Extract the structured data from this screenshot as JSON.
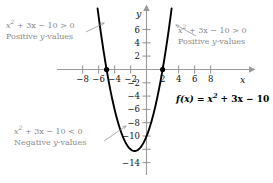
{
  "chart_data": {
    "type": "line",
    "title": "",
    "function_label": "f(x) = x^2 + 3x - 10",
    "equation_coefficients": {
      "a": 1,
      "b": 3,
      "c": -10
    },
    "xlabel": "x",
    "ylabel": "y",
    "xlim": [
      -9.6,
      9.6
    ],
    "ylim": [
      -15.5,
      7.6
    ],
    "grid": false,
    "legend": "none",
    "x_ticks": [
      -8,
      -6,
      -4,
      -2,
      2,
      4,
      6,
      8
    ],
    "x_tick_labels": [
      "-8",
      "-6",
      "-4",
      "-2",
      "2",
      "4",
      "6",
      "8"
    ],
    "y_ticks": [
      6,
      4,
      2,
      -2,
      -4,
      -6,
      -8,
      -10,
      -12,
      -14
    ],
    "y_tick_labels": [
      "6",
      "4",
      "2",
      "-2",
      "-4",
      "-6",
      "-8",
      "-10",
      "",
      "-14"
    ],
    "roots": [
      -5,
      2
    ],
    "vertex": [
      -1.5,
      -12.25
    ],
    "points": [
      {
        "x": -5,
        "y": 0,
        "style": "filled-dot"
      },
      {
        "x": 2,
        "y": 0,
        "style": "filled-dot"
      }
    ],
    "curve_color": "#000000",
    "axis_color": "#9a9a9a",
    "annotation_color": "#8a8a8a",
    "series": [
      {
        "name": "f(x) = x^2 + 3x - 10",
        "x": [
          -6.1,
          -5.5,
          -5,
          -4.5,
          -4,
          -3.5,
          -3,
          -2.5,
          -2,
          -1.5,
          -1,
          -0.5,
          0,
          0.5,
          1,
          1.5,
          2,
          2.5,
          3,
          3.1
        ],
        "y": [
          9.01,
          4.75,
          0,
          -3.25,
          -6,
          -8.25,
          -10,
          -11.25,
          -12,
          -12.25,
          -12,
          -11.25,
          -10,
          -8.25,
          -6,
          -3.25,
          0,
          3.75,
          8,
          9.01
        ]
      }
    ]
  },
  "annotations": {
    "left": {
      "expression_prefix": "x",
      "expression_exponent": "2",
      "expression_rest": " + 3x − 10 > 0",
      "subtitle_prefix": "Positive ",
      "subtitle_var": "y",
      "subtitle_suffix": "-values",
      "arrow": "arrow-up-right"
    },
    "right": {
      "expression_prefix": "x",
      "expression_exponent": "2",
      "expression_rest": " + 3x − 10 > 0",
      "subtitle_prefix": "Positive ",
      "subtitle_var": "y",
      "subtitle_suffix": "-values",
      "arrow": "arrow-up-left"
    },
    "bottom": {
      "expression_prefix": "x",
      "expression_exponent": "2",
      "expression_rest": " + 3x − 10 < 0",
      "subtitle_prefix": "Negative ",
      "subtitle_var": "y",
      "subtitle_suffix": "-values",
      "arrow": "arrow-up-right"
    }
  },
  "function_label": {
    "fn": "f",
    "arg": "(x)",
    "equals": " = ",
    "var": "x",
    "exponent": "2",
    "rest": " + 3x − 10"
  },
  "axis_labels": {
    "x": "x",
    "y": "y"
  }
}
